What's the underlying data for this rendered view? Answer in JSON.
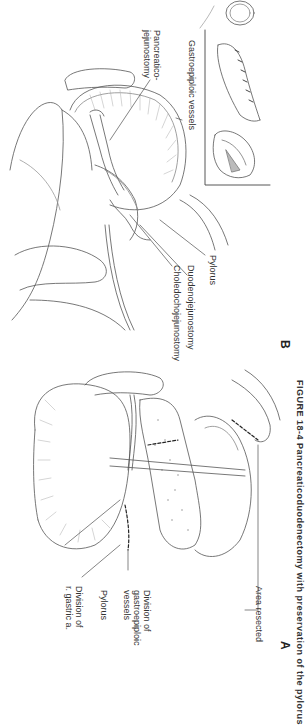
{
  "figure": {
    "caption": "FIGURE 18-4 Pancreaticoduodenectomy with preservation of the pylorus",
    "panels": [
      {
        "letter": "A",
        "labels": {
          "division_r_gastric_1": "Division of",
          "division_r_gastric_2": "r. gastric a.",
          "pylorus": "Pylorus",
          "division_gastroepiploic_1": "Division of",
          "division_gastroepiploic_2": "gastroepiploic",
          "division_gastroepiploic_3": "vessels",
          "area_resected": "Area resected"
        }
      },
      {
        "letter": "B",
        "labels": {
          "pancreaticojejunostomy_1": "Pancreatico-",
          "pancreaticojejunostomy_2": "jejunostomy",
          "gastroepiploic_vessels": "Gastroepiploic vessels",
          "choledochojejunostomy": "Choledochojejunostomy",
          "duodenojejunostomy": "Duodenojejunostomy",
          "pylorus": "Pylorus"
        }
      }
    ]
  },
  "colors": {
    "ink": "#3a3a3a",
    "background": "#ffffff"
  }
}
